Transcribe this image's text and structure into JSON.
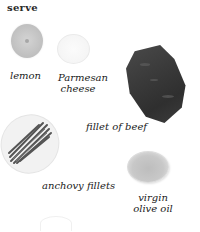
{
  "heading": "serve",
  "items": [
    {
      "id": "lemon",
      "label_lines": [
        "lemon"
      ]
    },
    {
      "id": "parmesan",
      "label_lines": [
        "Parmesan",
        "cheese"
      ]
    },
    {
      "id": "beef",
      "label_lines": [
        "fillet of beef"
      ]
    },
    {
      "id": "anchovy",
      "label_lines": [
        "anchovy fillets"
      ]
    },
    {
      "id": "olive-oil",
      "label_lines": [
        "virgin",
        "olive oil"
      ]
    }
  ],
  "colors": {
    "background": "#ffffff",
    "text": "#1a1a1a",
    "lemon": "#c6c6c6",
    "beef": "#3a3a3a",
    "anchovy": "#5a5a5a",
    "oil": "#c8c8c8"
  }
}
